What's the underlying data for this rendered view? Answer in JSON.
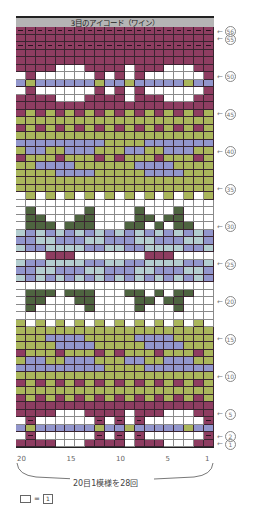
{
  "chart": {
    "title": "3目のアイコード（ワイン）",
    "columns": 20,
    "rows": 56,
    "column_ticks": [
      {
        "label": "20",
        "col": 20
      },
      {
        "label": "15",
        "col": 15
      },
      {
        "label": "10",
        "col": 10
      },
      {
        "label": "5",
        "col": 5
      },
      {
        "label": "1",
        "col": 1
      }
    ],
    "row_labels": [
      {
        "label": "56",
        "row": 56
      },
      {
        "label": "55",
        "row": 55
      },
      {
        "label": "50",
        "row": 50
      },
      {
        "label": "45",
        "row": 45
      },
      {
        "label": "40",
        "row": 40
      },
      {
        "label": "35",
        "row": 35
      },
      {
        "label": "30",
        "row": 30
      },
      {
        "label": "25",
        "row": 25
      },
      {
        "label": "20",
        "row": 20
      },
      {
        "label": "15",
        "row": 15
      },
      {
        "label": "10",
        "row": 10
      },
      {
        "label": "5",
        "row": 5
      },
      {
        "label": "2",
        "row": 2
      },
      {
        "label": "1",
        "row": 1
      }
    ],
    "repeat_note": "20目1模様を28回",
    "legend": {
      "eq": "=",
      "symbol": "1"
    },
    "colors": {
      "W": "#8e3d61",
      "w": "#ffffff",
      "B": "#9296cc",
      "G": "#aab65c",
      "D": "#4e6440",
      "L": "#b3cdd0"
    },
    "dash_rows": [
      56,
      54,
      4,
      2
    ],
    "pattern_top_to_bottom": [
      "WWWWWWWWWWWWWWWWWWWW",
      "WWWWWWWWWWWWWWWWWWWW",
      "WWWWWWWWWWWWWWWWWWWW",
      "WWWWWWWWWWWWWWWWWWWW",
      "WWWWWWWWWWWWWWWWWWWW",
      "WWWWwwwWWWWwWWWwwwWW",
      "wWwwwwwwWwWwWwwwwwwW",
      "BGBBBBBBGBBGBBBBBGBB",
      "wWwwwwwwWwWwWwwwwwwW",
      "WWWWwwwWWWWwWWWwwwWW",
      "WWWWWWWWWWWWWWWWWWWW",
      "WGWGWGWGWGWGWGWGWGWG",
      "GGGGGGGGGGGGGGGGGGGG",
      "WGWGWGWGWGWGWGWGWGWG",
      "GGGGGGGGGGGGGGGGGGGG",
      "BBBBBBBBBGGGGBBBBBBB",
      "GBBGGBBBGGGBBGGBBBGG",
      "WGGGWGGGWGWGGGWGGGWG",
      "GGBBBBGGGGGGBBBBGGGG",
      "GGGGBBBBGGGGGBBBBGGG",
      "GGGGGGGGGGGGGGGGGGGG",
      "GGGGGGGGGGGGGGGGGGGG",
      "wGwGwGwGwGwGwGwGwGwG",
      "wwwwwwwwwwwwwwwwwwww",
      "wDwwwwwDwwwwDwwwDwww",
      "wDDwwwDDwwwwDDwDDwww",
      "wDDDwDDDwwwDDwDwDDww",
      "LBLBLBLBLBLBLBLBLBLB",
      "BBLLBBBLLBBBLLBBBLLB",
      "LBBLLLLBBLLBBLLLLBBL",
      "wwwWWWwwwwwwwWWWwwww",
      "LBBLLLLBBLLBBLLLLBBL",
      "BBLLBBBLLBBBLLBBBLLB",
      "LBLBLBLBLBLBLBLBLBLB",
      "wwwwwwwwwwwwwwwwwwww",
      "wDDDwDDDwwwDDwDwDDww",
      "wDDwwwDDwwwwDDwDDwww",
      "wDwwwwwDwwwwDwwwDwww",
      "wwwwwwwwwwwwwwwwwwww",
      "GwGwGwGwGwGwGwGwGwGw",
      "GGGGGGGGGGGGGGGGGGGG",
      "GGGBBBBGGGGGBBBBGGGG",
      "GGGGBBBBGGGGGBBBBGGG",
      "WGGGWGGGWGWGGGWGGGWG",
      "GBBGGBBBGGGBBGGBBBGG",
      "BBBBBBBBBGGGGBBBBBBB",
      "GGGGGGGGGGGGGGGGGGGG",
      "WGWGWGWGWGWGWGWGWGWG",
      "GGGGGGGGGGGGGGGGGGGG",
      "WGWGWGWGWGWGWGWGWGWG",
      "WWWWWWWWWWWWWWWWWWWW",
      "WWWWwwwWWWWwWWWwwwWW",
      "wWwwwwwwWwWwWwwwwwwW",
      "BGBBBBBBGBBGBBBBBGBB",
      "wWwwwwwwWwWwWwwwwwwW",
      "WWWWwwwWWWWwWWWwwwWW"
    ],
    "pattern_bottom_rows": [
      "WWWWWWWWWWWWWWWWWWWW",
      "WWWWWWWWWWWWWWWWWWWW",
      "WWWWWWWWWWWWWWWWWWWW",
      "WWWWWWWWWWWWWWWWWWWW"
    ]
  }
}
